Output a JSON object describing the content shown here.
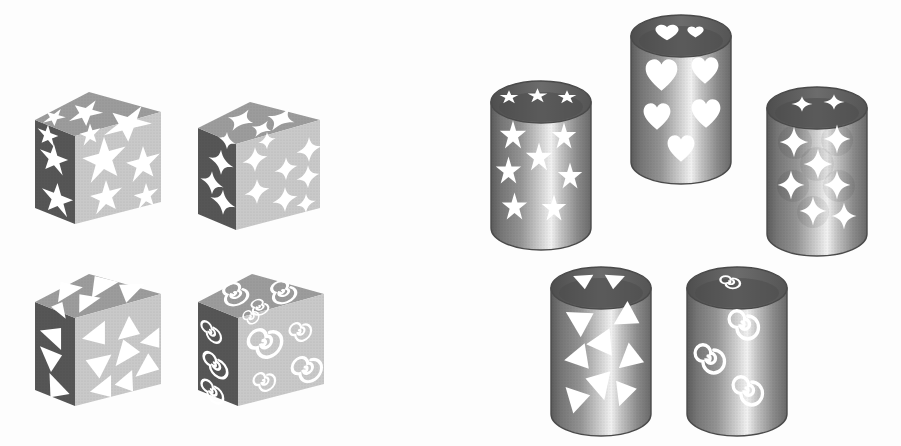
{
  "scene": {
    "title": "Shape-decorated cubes and cylinders",
    "background_color": "#fdfdfd",
    "width": 901,
    "height": 446,
    "description": "Four grey cubes on the left and five grey cylinders on the right, each perforated with a repeating white motif."
  },
  "palette": {
    "face_top": "#9a9a9a",
    "face_left": "#585858",
    "face_right": "#c9c9c9",
    "cutout": "#ffffff",
    "cylinder_rim_dark": "#5f5f5f",
    "cylinder_body_dark": "#6e6e6e",
    "cylinder_body_mid": "#a8a8a8",
    "cylinder_body_light": "#ededed",
    "outline": "#4a4a4a"
  },
  "cubes": [
    {
      "id": "cube-star5",
      "label": "Cube with five-pointed stars",
      "motif": "star5",
      "motif_label": "five-pointed star",
      "x": 33,
      "y": 90,
      "size": 128,
      "counts": {
        "top": 3,
        "left": 3,
        "right": 5,
        "total_visible": 11
      }
    },
    {
      "id": "cube-star4",
      "label": "Cube with four-pointed stars",
      "motif": "star4",
      "motif_label": "four-pointed star",
      "x": 196,
      "y": 100,
      "size": 122,
      "counts": {
        "top": 3,
        "left": 4,
        "right": 8,
        "total_visible": 15
      }
    },
    {
      "id": "cube-triangle",
      "label": "Cube with triangles",
      "motif": "triangle",
      "motif_label": "triangle",
      "x": 33,
      "y": 272,
      "size": 128,
      "counts": {
        "top": 4,
        "left": 4,
        "right": 8,
        "total_visible": 16
      }
    },
    {
      "id": "cube-spiral",
      "label": "Cube with spirals",
      "motif": "spiral",
      "motif_label": "spiral",
      "x": 196,
      "y": 272,
      "size": 126,
      "counts": {
        "top": 3,
        "left": 3,
        "right": 5,
        "total_visible": 11
      }
    }
  ],
  "cylinders": [
    {
      "id": "cylinder-star5",
      "label": "Cylinder with five-pointed stars",
      "motif": "star5",
      "motif_label": "five-pointed star",
      "x": 489,
      "y": 76,
      "width": 100,
      "height": 176,
      "counts": {
        "rim": 3,
        "body": 7,
        "total_visible": 10
      }
    },
    {
      "id": "cylinder-heart",
      "label": "Cylinder with hearts",
      "motif": "heart",
      "motif_label": "heart",
      "x": 629,
      "y": 10,
      "width": 100,
      "height": 176,
      "counts": {
        "rim": 2,
        "body": 5,
        "total_visible": 7
      }
    },
    {
      "id": "cylinder-star4",
      "label": "Cylinder with four-pointed stars",
      "motif": "star4",
      "motif_label": "four-pointed star",
      "x": 765,
      "y": 82,
      "width": 100,
      "height": 176,
      "counts": {
        "rim": 2,
        "body": 7,
        "total_visible": 9
      }
    },
    {
      "id": "cylinder-triangle",
      "label": "Cylinder with triangles",
      "motif": "triangle",
      "motif_label": "triangle",
      "x": 549,
      "y": 262,
      "width": 100,
      "height": 176,
      "counts": {
        "rim": 2,
        "body": 8,
        "total_visible": 10
      }
    },
    {
      "id": "cylinder-spiral",
      "label": "Cylinder with spirals",
      "motif": "spiral",
      "motif_label": "spiral",
      "x": 685,
      "y": 262,
      "width": 100,
      "height": 176,
      "counts": {
        "rim": 1,
        "body": 3,
        "total_visible": 4
      }
    }
  ],
  "motif_shapes": {
    "star5": {
      "name": "five-pointed star",
      "points": 5
    },
    "star4": {
      "name": "four-pointed star",
      "points": 4
    },
    "triangle": {
      "name": "triangle",
      "points": 3
    },
    "heart": {
      "name": "heart",
      "points": 0
    },
    "spiral": {
      "name": "spiral",
      "points": 0
    }
  }
}
